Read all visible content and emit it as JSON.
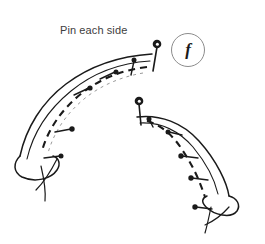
{
  "figure": {
    "title": "Pin each side",
    "caption": "Pin each side",
    "step_label": "f",
    "background_color": "#ffffff",
    "ink_color": "#1a1a1a",
    "caption_color": "#3d3d3d",
    "circle_stroke_color": "#8c8c8c",
    "faint_ink_color": "#9a9a9a",
    "width": 265,
    "height": 244,
    "pieces": [
      {
        "name": "left-fabric-panel",
        "outer_edge": "M 152,54 C 120,56 90,66 66,84 C 42,102 26,128 20,156",
        "inner_edge": "M 151,62 C 118,64 92,74 70,92 C 48,110 32,134 26,160",
        "seam_dashed": "M 147,66 C 122,69 100,78 82,92 C 62,108 48,128 42,150",
        "seam_faint": "M 143,72 C 120,76 100,85 84,98 C 66,113 54,131 48,152",
        "end_fold": "M 20,156 C 14,164 14,172 22,176 C 34,182 50,178 56,170 C 60,164 58,158 52,156",
        "thread_tails": [
          "M 42,166 C 44,178 46,190 45,200",
          "M 56,160 C 50,172 44,182 36,190"
        ]
      },
      {
        "name": "right-fabric-panel",
        "outer_edge": "M 138,116 C 160,114 182,122 198,140 C 216,160 226,182 228,196",
        "inner_edge": "M 140,122 C 160,121 178,129 192,146 C 206,163 214,180 217,194",
        "seam_dashed": "M 146,120 C 160,124 172,134 182,150 C 194,168 200,184 204,196",
        "end_fold": "M 228,196 C 236,198 240,204 236,210 C 230,218 214,214 206,206 C 202,202 202,198 206,196",
        "thread_tails": [
          "M 212,206 C 210,216 208,224 206,232",
          "M 228,206 C 222,214 214,220 206,224"
        ]
      }
    ],
    "pins": [
      {
        "id": "pin-left-apex",
        "panel": "left",
        "head_x": 157,
        "head_y": 45,
        "tip_x": 153,
        "tip_y": 70,
        "head_style": "ball-open",
        "head_r": 4.2
      },
      {
        "id": "pin-left-1",
        "panel": "left",
        "head_x": 134,
        "head_y": 60,
        "tip_x": 131,
        "tip_y": 74,
        "head_style": "solid",
        "head_r": 2.4
      },
      {
        "id": "pin-left-2",
        "panel": "left",
        "head_x": 115,
        "head_y": 72,
        "tip_x": 100,
        "tip_y": 79,
        "head_style": "solid",
        "head_r": 2.4
      },
      {
        "id": "pin-left-3",
        "panel": "left",
        "head_x": 89,
        "head_y": 88,
        "tip_x": 74,
        "tip_y": 95,
        "head_style": "solid",
        "head_r": 2.4
      },
      {
        "id": "pin-left-4",
        "panel": "left",
        "head_x": 71,
        "head_y": 129,
        "tip_x": 55,
        "tip_y": 132,
        "head_style": "solid",
        "head_r": 2.6
      },
      {
        "id": "pin-left-5",
        "panel": "left",
        "head_x": 60,
        "head_y": 156,
        "tip_x": 44,
        "tip_y": 158,
        "head_style": "solid",
        "head_r": 2.4
      },
      {
        "id": "pin-right-apex",
        "panel": "right",
        "head_x": 139,
        "head_y": 101,
        "tip_x": 141,
        "tip_y": 124,
        "head_style": "ball-open",
        "head_r": 4.2
      },
      {
        "id": "pin-right-1",
        "panel": "right",
        "head_x": 149,
        "head_y": 119,
        "tip_x": 152,
        "tip_y": 126,
        "head_style": "solid",
        "head_r": 2.4
      },
      {
        "id": "pin-right-2",
        "panel": "right",
        "head_x": 169,
        "head_y": 132,
        "tip_x": 181,
        "tip_y": 135,
        "head_style": "solid",
        "head_r": 2.4
      },
      {
        "id": "pin-right-3",
        "panel": "right",
        "head_x": 182,
        "head_y": 156,
        "tip_x": 198,
        "tip_y": 158,
        "head_style": "solid",
        "head_r": 2.6
      },
      {
        "id": "pin-right-4",
        "panel": "right",
        "head_x": 192,
        "head_y": 178,
        "tip_x": 208,
        "tip_y": 180,
        "head_style": "solid",
        "head_r": 2.6
      },
      {
        "id": "pin-right-5",
        "panel": "right",
        "head_x": 196,
        "head_y": 207,
        "tip_x": 212,
        "tip_y": 209,
        "head_style": "solid",
        "head_r": 2.6
      }
    ]
  }
}
